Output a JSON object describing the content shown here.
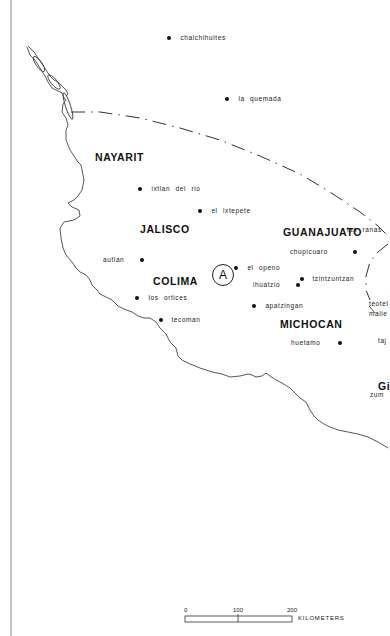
{
  "map": {
    "states": [
      {
        "name": "NAYARIT",
        "x": 95,
        "y": 152
      },
      {
        "name": "JALISCO",
        "x": 140,
        "y": 224
      },
      {
        "name": "GUANAJUATO",
        "x": 283,
        "y": 227
      },
      {
        "name": "COLIMA",
        "x": 153,
        "y": 276
      },
      {
        "name": "MICHOCAN",
        "x": 280,
        "y": 320
      },
      {
        "name": "Gi",
        "x": 378,
        "y": 382
      }
    ],
    "sites": [
      {
        "name": "chalchihuites",
        "dot_x": 169,
        "dot_y": 37,
        "label_side": "right"
      },
      {
        "name": "la quemada",
        "dot_x": 227,
        "dot_y": 98,
        "label_side": "right"
      },
      {
        "name": "ixtlan del rio",
        "dot_x": 140,
        "dot_y": 188,
        "label_side": "right"
      },
      {
        "name": "el ixtepete",
        "dot_x": 200,
        "dot_y": 210,
        "label_side": "right"
      },
      {
        "name": "las ranas",
        "dot_x": null,
        "dot_y": 229,
        "label_x": 347,
        "label_side": "none"
      },
      {
        "name": "chupicuaro",
        "dot_x": 353,
        "dot_y": 251,
        "label_side": "left"
      },
      {
        "name": "autlan",
        "dot_x": 137,
        "dot_y": 259,
        "label_side": "left"
      },
      {
        "name": "el openo",
        "dot_x": 236,
        "dot_y": 267,
        "label_side": "right"
      },
      {
        "name": "tzintzuntzan",
        "dot_x": 302,
        "dot_y": 279,
        "label_side": "right"
      },
      {
        "name": "ihuatzio",
        "dot_x": 298,
        "dot_y": 283,
        "label_side": "left"
      },
      {
        "name": "los ortices",
        "dot_x": 137,
        "dot_y": 297,
        "label_side": "right"
      },
      {
        "name": "apatzingan",
        "dot_x": 254,
        "dot_y": 305,
        "label_side": "right"
      },
      {
        "name": "tecoman",
        "dot_x": 161,
        "dot_y": 319,
        "label_side": "right"
      },
      {
        "name": "huetamo",
        "dot_x": 337,
        "dot_y": 342,
        "label_side": "left"
      },
      {
        "name": "teotel",
        "dot_x": null,
        "dot_y": 303,
        "label_x": 369,
        "label_side": "none"
      },
      {
        "name": "malie",
        "dot_x": null,
        "dot_y": 313,
        "label_x": 369,
        "label_side": "none"
      },
      {
        "name": "taj",
        "dot_x": null,
        "dot_y": 340,
        "label_x": 378,
        "label_side": "none"
      },
      {
        "name": "zum",
        "dot_x": null,
        "dot_y": 393,
        "label_x": 370,
        "label_side": "none"
      }
    ],
    "marker": {
      "label": "A"
    }
  },
  "scale_bar": {
    "ticks": [
      "0",
      "100",
      "200"
    ],
    "unit": "KILOMETERS"
  }
}
